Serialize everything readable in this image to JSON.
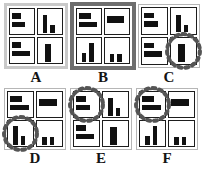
{
  "figure": {
    "title": "",
    "panel_count": 6,
    "grid": {
      "rows": 2,
      "cols": 3
    }
  },
  "panels": [
    {
      "id": "A",
      "label": "A",
      "frame_style": "gray",
      "frame_color": "#c9c9c9",
      "highlight": null,
      "charts": [
        {
          "position": "top-left",
          "type": "bar",
          "orientation": "horizontal",
          "categories": [
            "c1",
            "c2"
          ],
          "values": [
            0.46,
            0.66
          ],
          "xlim": [
            0,
            1
          ],
          "highlighted": false
        },
        {
          "position": "top-right",
          "type": "bar",
          "orientation": "vertical",
          "categories": [
            "c1",
            "c2"
          ],
          "values": [
            0.82,
            0.34
          ],
          "ylim": [
            0,
            1
          ],
          "highlighted": false
        },
        {
          "position": "bottom-left",
          "type": "bar",
          "orientation": "horizontal",
          "categories": [
            "c1",
            "c2"
          ],
          "values": [
            0.46,
            0.88
          ],
          "xlim": [
            0,
            1
          ],
          "highlighted": false
        },
        {
          "position": "bottom-right",
          "type": "bar",
          "orientation": "vertical",
          "categories": [
            "c1"
          ],
          "values": [
            0.84
          ],
          "ylim": [
            0,
            1
          ],
          "highlighted": false
        }
      ]
    },
    {
      "id": "B",
      "label": "B",
      "frame_style": "dark",
      "frame_color": "#6e6e6e",
      "highlight": null,
      "charts": [
        {
          "position": "top-left",
          "type": "bar",
          "orientation": "horizontal",
          "categories": [
            "c1",
            "c2"
          ],
          "values": [
            0.58,
            0.92
          ],
          "xlim": [
            0,
            1
          ],
          "highlighted": false
        },
        {
          "position": "top-right",
          "type": "bar",
          "orientation": "horizontal",
          "categories": [
            "c1"
          ],
          "values": [
            0.86
          ],
          "xlim": [
            0,
            1
          ],
          "highlighted": false
        },
        {
          "position": "bottom-left",
          "type": "bar",
          "orientation": "vertical",
          "categories": [
            "c1",
            "c2"
          ],
          "values": [
            0.42,
            0.86
          ],
          "ylim": [
            0,
            1
          ],
          "highlighted": false
        },
        {
          "position": "bottom-right",
          "type": "bar",
          "orientation": "vertical",
          "categories": [
            "c1",
            "c2"
          ],
          "values": [
            0.36,
            0.36
          ],
          "ylim": [
            0,
            1
          ],
          "highlighted": false
        }
      ]
    },
    {
      "id": "C",
      "label": "C",
      "frame_style": "plain",
      "frame_color": "#b6b6b6",
      "highlight": "bottom-right",
      "charts": [
        {
          "position": "top-left",
          "type": "bar",
          "orientation": "horizontal",
          "categories": [
            "c1",
            "c2"
          ],
          "values": [
            0.46,
            0.66
          ],
          "xlim": [
            0,
            1
          ],
          "highlighted": false
        },
        {
          "position": "top-right",
          "type": "bar",
          "orientation": "vertical",
          "categories": [
            "c1",
            "c2"
          ],
          "values": [
            0.82,
            0.34
          ],
          "ylim": [
            0,
            1
          ],
          "highlighted": false
        },
        {
          "position": "bottom-left",
          "type": "bar",
          "orientation": "horizontal",
          "categories": [
            "c1",
            "c2"
          ],
          "values": [
            0.46,
            0.88
          ],
          "xlim": [
            0,
            1
          ],
          "highlighted": false
        },
        {
          "position": "bottom-right",
          "type": "bar",
          "orientation": "vertical",
          "categories": [
            "c1"
          ],
          "values": [
            0.84
          ],
          "ylim": [
            0,
            1
          ],
          "highlighted": true
        }
      ]
    },
    {
      "id": "D",
      "label": "D",
      "frame_style": "plain",
      "frame_color": "#b6b6b6",
      "highlight": "bottom-left",
      "charts": [
        {
          "position": "top-left",
          "type": "bar",
          "orientation": "horizontal",
          "categories": [
            "c1",
            "c2"
          ],
          "values": [
            0.58,
            0.92
          ],
          "xlim": [
            0,
            1
          ],
          "highlighted": false
        },
        {
          "position": "top-right",
          "type": "bar",
          "orientation": "horizontal",
          "categories": [
            "c1"
          ],
          "values": [
            0.86
          ],
          "xlim": [
            0,
            1
          ],
          "highlighted": false
        },
        {
          "position": "bottom-left",
          "type": "bar",
          "orientation": "vertical",
          "categories": [
            "c1",
            "c2"
          ],
          "values": [
            0.86,
            0.42
          ],
          "ylim": [
            0,
            1
          ],
          "highlighted": true
        },
        {
          "position": "bottom-right",
          "type": "bar",
          "orientation": "vertical",
          "categories": [
            "c1",
            "c2"
          ],
          "values": [
            0.36,
            0.36
          ],
          "ylim": [
            0,
            1
          ],
          "highlighted": false
        }
      ]
    },
    {
      "id": "E",
      "label": "E",
      "frame_style": "plain",
      "frame_color": "#b6b6b6",
      "highlight": "top-left",
      "charts": [
        {
          "position": "top-left",
          "type": "bar",
          "orientation": "horizontal",
          "categories": [
            "c1",
            "c2"
          ],
          "values": [
            0.46,
            0.66
          ],
          "xlim": [
            0,
            1
          ],
          "highlighted": true
        },
        {
          "position": "top-right",
          "type": "bar",
          "orientation": "vertical",
          "categories": [
            "c1",
            "c2"
          ],
          "values": [
            0.82,
            0.34
          ],
          "ylim": [
            0,
            1
          ],
          "highlighted": false
        },
        {
          "position": "bottom-left",
          "type": "bar",
          "orientation": "horizontal",
          "categories": [
            "c1",
            "c2"
          ],
          "values": [
            0.46,
            0.88
          ],
          "xlim": [
            0,
            1
          ],
          "highlighted": false
        },
        {
          "position": "bottom-right",
          "type": "bar",
          "orientation": "vertical",
          "categories": [
            "c1"
          ],
          "values": [
            0.84
          ],
          "ylim": [
            0,
            1
          ],
          "highlighted": false
        }
      ]
    },
    {
      "id": "F",
      "label": "F",
      "frame_style": "plain",
      "frame_color": "#b6b6b6",
      "highlight": "top-left",
      "charts": [
        {
          "position": "top-left",
          "type": "bar",
          "orientation": "horizontal",
          "categories": [
            "c1",
            "c2"
          ],
          "values": [
            0.58,
            0.92
          ],
          "xlim": [
            0,
            1
          ],
          "highlighted": true
        },
        {
          "position": "top-right",
          "type": "bar",
          "orientation": "horizontal",
          "categories": [
            "c1"
          ],
          "values": [
            0.86
          ],
          "xlim": [
            0,
            1
          ],
          "highlighted": false
        },
        {
          "position": "bottom-left",
          "type": "bar",
          "orientation": "vertical",
          "categories": [
            "c1",
            "c2"
          ],
          "values": [
            0.42,
            0.86
          ],
          "ylim": [
            0,
            1
          ],
          "highlighted": false
        },
        {
          "position": "bottom-right",
          "type": "bar",
          "orientation": "vertical",
          "categories": [
            "c1",
            "c2"
          ],
          "values": [
            0.36,
            0.36
          ],
          "ylim": [
            0,
            1
          ],
          "highlighted": false
        }
      ]
    }
  ],
  "colors": {
    "bar": "#111111",
    "cell_border": "#1d1d1d",
    "frame_plain": "#b6b6b6",
    "frame_gray": "#c9c9c9",
    "frame_dark": "#6e6e6e",
    "highlight_circle": "#555555",
    "background": "#ffffff",
    "label_text": "#141414"
  },
  "labels": {
    "a": "A",
    "b": "B",
    "c": "C",
    "d": "D",
    "e": "E",
    "f": "F"
  }
}
